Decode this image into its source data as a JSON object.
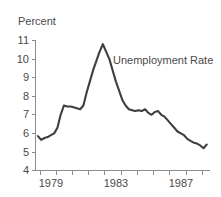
{
  "chart_data": {
    "type": "line",
    "title": "",
    "ylabel": "Percent",
    "xlabel": "",
    "ylim": [
      4,
      11
    ],
    "xlim": [
      1978.75,
      1989.5
    ],
    "grid": false,
    "legend_position": "inline-annotation",
    "y_ticks": [
      4,
      5,
      6,
      7,
      8,
      9,
      10,
      11
    ],
    "y_tick_labels": [
      "4",
      "5",
      "6",
      "7",
      "8",
      "9",
      "10",
      "11"
    ],
    "x_ticks": [
      1979,
      1980,
      1981,
      1982,
      1983,
      1984,
      1985,
      1986,
      1987,
      1988,
      1989
    ],
    "x_tick_labels_shown": [
      "1979",
      "1983",
      "1987"
    ],
    "x_labeled_ticks": [
      1979,
      1983,
      1987
    ],
    "series": [
      {
        "name": "Unemployment Rate",
        "color": "#3f3f3f",
        "x": [
          1978.9,
          1979.1,
          1979.3,
          1979.5,
          1979.7,
          1979.9,
          1980.1,
          1980.3,
          1980.5,
          1980.7,
          1980.9,
          1981.1,
          1981.3,
          1981.5,
          1981.7,
          1981.9,
          1982.1,
          1982.3,
          1982.5,
          1982.7,
          1982.9,
          1983.1,
          1983.3,
          1983.5,
          1983.7,
          1983.9,
          1984.1,
          1984.3,
          1984.5,
          1984.7,
          1984.9,
          1985.1,
          1985.3,
          1985.5,
          1985.7,
          1985.9,
          1986.1,
          1986.3,
          1986.5,
          1986.7,
          1986.9,
          1987.1,
          1987.3,
          1987.5,
          1987.7,
          1987.9,
          1988.1,
          1988.3,
          1988.5,
          1988.7,
          1988.9,
          1989.1,
          1989.3
        ],
        "y": [
          5.85,
          5.65,
          5.75,
          5.8,
          5.9,
          6.0,
          6.3,
          7.0,
          7.5,
          7.45,
          7.45,
          7.4,
          7.35,
          7.3,
          7.5,
          8.2,
          8.8,
          9.4,
          9.9,
          10.4,
          10.8,
          10.4,
          10.0,
          9.4,
          8.8,
          8.3,
          7.8,
          7.5,
          7.3,
          7.25,
          7.2,
          7.25,
          7.2,
          7.3,
          7.1,
          7.0,
          7.15,
          7.2,
          7.0,
          6.9,
          6.7,
          6.5,
          6.3,
          6.1,
          6.0,
          5.9,
          5.7,
          5.6,
          5.5,
          5.45,
          5.35,
          5.2,
          5.4
        ],
        "annotation_label": "Unemployment Rate"
      }
    ]
  },
  "labels": {
    "y_axis_title": "Percent",
    "series_annotation": "Unemployment Rate",
    "x_label_1": "1979",
    "x_label_2": "1983",
    "x_label_3": "1987",
    "y_label_11": "11",
    "y_label_10": "10",
    "y_label_9": "9",
    "y_label_8": "8",
    "y_label_7": "7",
    "y_label_6": "6",
    "y_label_5": "5",
    "y_label_4": "4"
  },
  "colors": {
    "line": "#3f3f3f",
    "axis": "#8d8d8d",
    "text": "#4a4a4a",
    "background": "#ffffff"
  }
}
